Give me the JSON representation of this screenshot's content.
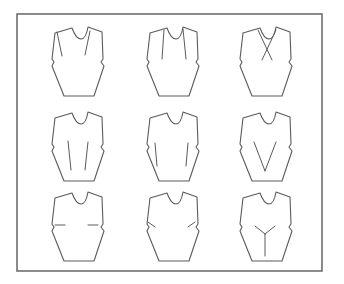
{
  "figure": {
    "frame": {
      "x": 17,
      "y": 14,
      "width": 305,
      "height": 257
    },
    "colors": {
      "line": "#5a5a5a",
      "frame": "#6e6e6e",
      "background": "#ffffff"
    }
  },
  "bodices": [
    {
      "id": "shoulder-darts",
      "row": 1,
      "col": 1,
      "origin": [
        48,
        26
      ],
      "darts": [
        [
          [
            9,
            6
          ],
          [
            14,
            30
          ]
        ],
        [
          [
            42,
            5
          ],
          [
            37,
            29
          ]
        ]
      ]
    },
    {
      "id": "neck-darts",
      "row": 1,
      "col": 2,
      "origin": [
        143,
        26
      ],
      "darts": [
        [
          [
            21,
            4
          ],
          [
            19,
            33
          ]
        ],
        [
          [
            40,
            3
          ],
          [
            43,
            33
          ]
        ]
      ]
    },
    {
      "id": "crossed-neck-darts",
      "row": 1,
      "col": 3,
      "origin": [
        236,
        26
      ],
      "darts": [
        [
          [
            22,
            4
          ],
          [
            36,
            34
          ]
        ],
        [
          [
            40,
            4
          ],
          [
            26,
            34
          ]
        ]
      ]
    },
    {
      "id": "waist-tucks",
      "row": 2,
      "col": 1,
      "origin": [
        48,
        111
      ],
      "darts": [
        [
          [
            20,
            30
          ],
          [
            23,
            59
          ]
        ],
        [
          [
            40,
            31
          ],
          [
            37,
            59
          ]
        ]
      ]
    },
    {
      "id": "waist-darts",
      "row": 2,
      "col": 2,
      "origin": [
        143,
        111
      ],
      "darts": [
        [
          [
            12,
            32
          ],
          [
            14,
            55
          ]
        ],
        [
          [
            45,
            32
          ],
          [
            43,
            55
          ]
        ]
      ]
    },
    {
      "id": "center-waist-v-darts",
      "row": 2,
      "col": 3,
      "origin": [
        236,
        111
      ],
      "darts": [
        [
          [
            18,
            31
          ],
          [
            29,
            60
          ]
        ],
        [
          [
            40,
            31
          ],
          [
            29,
            60
          ]
        ]
      ]
    },
    {
      "id": "side-darts-horizontal",
      "row": 3,
      "col": 1,
      "origin": [
        48,
        191
      ],
      "darts": [
        [
          [
            7,
            34
          ],
          [
            17,
            34
          ]
        ],
        [
          [
            50,
            34
          ],
          [
            40,
            34
          ]
        ]
      ]
    },
    {
      "id": "side-darts-angled",
      "row": 3,
      "col": 2,
      "origin": [
        143,
        191
      ],
      "darts": [
        [
          [
            5,
            31
          ],
          [
            12,
            36
          ]
        ],
        [
          [
            52,
            31
          ],
          [
            45,
            36
          ]
        ]
      ]
    },
    {
      "id": "y-center-seam",
      "row": 3,
      "col": 3,
      "origin": [
        236,
        191
      ],
      "darts": [
        [
          [
            19,
            35
          ],
          [
            29,
            43
          ]
        ],
        [
          [
            39,
            35
          ],
          [
            29,
            43
          ]
        ],
        [
          [
            29,
            43
          ],
          [
            29,
            65
          ]
        ]
      ]
    }
  ]
}
